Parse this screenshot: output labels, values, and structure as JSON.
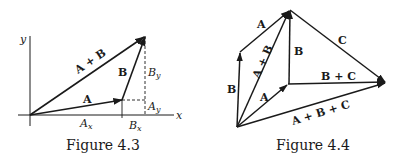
{
  "figures": [
    {
      "caption": "Figure 4.3",
      "axes": {
        "x_label": "x",
        "y_label": "y"
      },
      "vectors": [
        {
          "label": "A",
          "from": "origin",
          "to": "A-tip"
        },
        {
          "label": "B",
          "from": "A-tip",
          "to": "sum-tip"
        },
        {
          "label": "A + B",
          "from": "origin",
          "to": "sum-tip"
        }
      ],
      "component_labels": {
        "ax": "A",
        "ax_sub": "x",
        "bx": "B",
        "bx_sub": "x",
        "ay": "A",
        "ay_sub": "y",
        "by": "B",
        "by_sub": "y"
      }
    },
    {
      "caption": "Figure 4.4",
      "vectors": [
        {
          "label": "B",
          "segment": "left-vertical"
        },
        {
          "label": "A",
          "segment": "upper-left"
        },
        {
          "label": "A + B",
          "segment": "diagonal"
        },
        {
          "label": "B",
          "segment": "center-vertical"
        },
        {
          "label": "A",
          "segment": "lower-inner"
        },
        {
          "label": "C",
          "segment": "upper-right"
        },
        {
          "label": "B + C",
          "segment": "horizontal"
        },
        {
          "label": "A + B + C",
          "segment": "bottom"
        }
      ]
    }
  ]
}
